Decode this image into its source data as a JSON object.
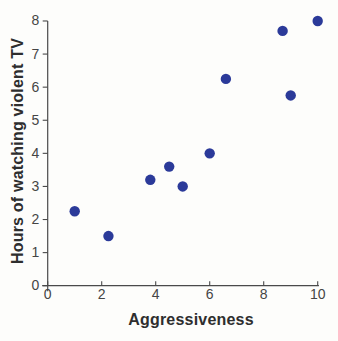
{
  "figure": {
    "background": "#fdfdfb"
  },
  "chart_data": {
    "type": "scatter",
    "xlabel": "Aggressiveness",
    "ylabel": "Hours of watching violent TV",
    "xlim": [
      0,
      10
    ],
    "ylim": [
      0,
      8
    ],
    "x_ticks": [
      "0",
      "2",
      "4",
      "6",
      "8",
      "10"
    ],
    "y_ticks": [
      "0",
      "1",
      "2",
      "3",
      "4",
      "5",
      "6",
      "7",
      "8"
    ],
    "grid": false,
    "points": [
      {
        "x": 1,
        "y": 2.25
      },
      {
        "x": 2.25,
        "y": 1.5
      },
      {
        "x": 3.8,
        "y": 3.2
      },
      {
        "x": 4.5,
        "y": 3.6
      },
      {
        "x": 5,
        "y": 3.0
      },
      {
        "x": 6,
        "y": 4.0
      },
      {
        "x": 6.6,
        "y": 6.25
      },
      {
        "x": 8.7,
        "y": 7.7
      },
      {
        "x": 9,
        "y": 5.75
      },
      {
        "x": 10,
        "y": 8.0
      }
    ],
    "marker": {
      "shape": "circle",
      "radius_px": 5.2,
      "color": "#2b3a99"
    },
    "axis_color": "#4a4a4a",
    "tick_label_color": "#454545",
    "axis_title_color": "#2e2e2e"
  }
}
